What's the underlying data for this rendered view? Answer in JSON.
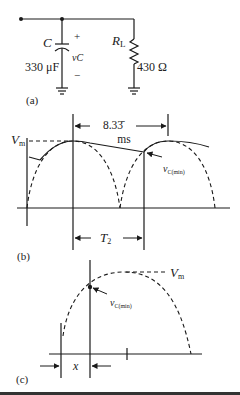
{
  "figure": {
    "panel_a": {
      "label": "(a)",
      "capacitor": {
        "symbol": "C",
        "value": "330 μF",
        "voltage_label": "vC",
        "plus": "+",
        "minus": "−"
      },
      "resistor": {
        "symbol": "R",
        "subscript": "L",
        "value": "430 Ω"
      }
    },
    "panel_b": {
      "label": "(b)",
      "period_top": {
        "value": "8.33̄",
        "unit": "ms"
      },
      "vm_label": "V",
      "vm_subscript": "m",
      "vc_min_label": "v",
      "vc_min_subscript": "C(min)",
      "t2_label": "T",
      "t2_subscript": "2"
    },
    "panel_c": {
      "label": "(c)",
      "vm_label": "V",
      "vm_subscript": "m",
      "vc_min_label": "v",
      "vc_min_subscript": "C(min)",
      "x_label": "x"
    }
  },
  "colors": {
    "line": "#1a1a1a",
    "background": "#ffffff"
  }
}
